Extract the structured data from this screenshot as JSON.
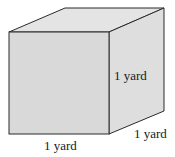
{
  "diagram": {
    "type": "cube",
    "colors": {
      "front": "#d9d9d9",
      "top": "#e4e4e4",
      "side": "#dedede",
      "edge": "#2a2a2a"
    },
    "labels": {
      "height": "1 yard",
      "width": "1 yard",
      "depth": "1 yard"
    }
  }
}
